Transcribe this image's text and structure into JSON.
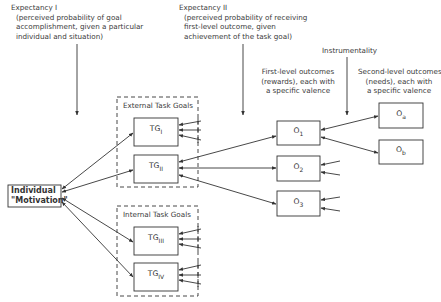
{
  "expectancy1": {
    "title": "Expectancy I",
    "lines": [
      "(perceived probability of goal",
      "accomplishment, given a particular",
      "individual and situation)"
    ]
  },
  "expectancy2": {
    "title": "Expectancy II",
    "lines": [
      "(perceived probability of receiving",
      "first-level outcome, given",
      "achievement of the task goal)"
    ]
  },
  "instrumentality": "Instrumentality",
  "first_level": {
    "lines": [
      "First-level outcomes",
      "(rewards), each with",
      "a specific valence"
    ]
  },
  "second_level": {
    "lines": [
      "Second-level outcomes",
      "(needs), each with",
      "a specific valence"
    ]
  },
  "individual": {
    "line1": "Individual",
    "line2": "\"Motivation\""
  },
  "external_group": "External Task Goals",
  "internal_group": "Internal Task Goals",
  "task_goals": [
    {
      "base": "TG",
      "sub": "I"
    },
    {
      "base": "TG",
      "sub": "II"
    },
    {
      "base": "TG",
      "sub": "III"
    },
    {
      "base": "TG",
      "sub": "IV"
    }
  ],
  "first_outcomes": [
    {
      "base": "O",
      "sub": "1"
    },
    {
      "base": "O",
      "sub": "2"
    },
    {
      "base": "O",
      "sub": "3"
    }
  ],
  "second_outcomes": [
    {
      "base": "O",
      "sub": "a"
    },
    {
      "base": "O",
      "sub": "b"
    }
  ]
}
